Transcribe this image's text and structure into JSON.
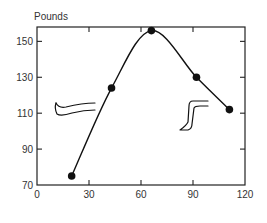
{
  "chart_data": {
    "type": "line",
    "title": "",
    "xlabel": "",
    "ylabel": "Pounds",
    "xlim": [
      0,
      120
    ],
    "ylim": [
      70,
      158
    ],
    "x_ticks": [
      0,
      30,
      60,
      90,
      120
    ],
    "y_ticks": [
      70,
      90,
      110,
      130,
      150
    ],
    "grid": false,
    "legend": null,
    "series": [
      {
        "name": "Pounds",
        "x": [
          20,
          43,
          66,
          92,
          111
        ],
        "y": [
          75,
          124,
          156,
          130,
          112
        ],
        "marker": "filled-circle",
        "line": "smooth",
        "color": "#111111"
      }
    ],
    "annotations": [
      {
        "type": "illustration",
        "label": "extended-leg-icon",
        "near_x": 12,
        "near_y": 111
      },
      {
        "type": "illustration",
        "label": "bent-knee-leg-icon",
        "near_x": 88,
        "near_y": 110
      }
    ]
  },
  "labels": {
    "ylabel": "Pounds",
    "x_ticks": [
      "0",
      "30",
      "60",
      "90",
      "120"
    ],
    "y_ticks": [
      "70",
      "90",
      "110",
      "130",
      "150"
    ]
  }
}
